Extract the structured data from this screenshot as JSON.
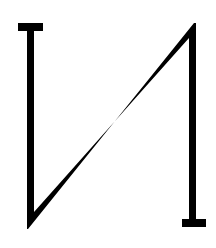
{
  "figure": {
    "icon": "zigzag-n-glyph-icon",
    "colors": {
      "background": "#ffffff",
      "stroke": "#000000"
    }
  }
}
